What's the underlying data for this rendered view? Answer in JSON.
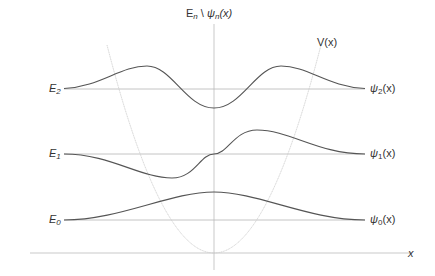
{
  "diagram": {
    "y_axis_label": {
      "prefix": "E",
      "prefix_sub": "n",
      "sep": " \\ ",
      "psi": "ψ",
      "psi_sub": "n",
      "arg": "(x)"
    },
    "x_axis_label": "x",
    "potential_label": "V(x)",
    "levels": [
      {
        "energy_label": "E",
        "energy_sub": "0",
        "wf_label": "ψ",
        "wf_sub": "0",
        "wf_arg": "(x)"
      },
      {
        "energy_label": "E",
        "energy_sub": "1",
        "wf_label": "ψ",
        "wf_sub": "1",
        "wf_arg": "(x)"
      },
      {
        "energy_label": "E",
        "energy_sub": "2",
        "wf_label": "ψ",
        "wf_sub": "2",
        "wf_arg": "(x)"
      }
    ],
    "colors": {
      "wavefunction": "#555555",
      "baseline": "#b0b0b0",
      "potential": "#c8c8c8",
      "axis": "#b0b0b0",
      "text": "#333333"
    }
  }
}
